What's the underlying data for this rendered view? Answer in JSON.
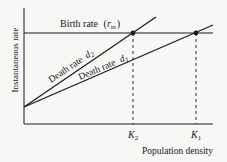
{
  "diagram": {
    "y_axis_label": "Instantaneous rate",
    "x_axis_label": "Population density",
    "birth_rate": {
      "label": "Birth rate",
      "symbol": "r",
      "subscript": "m"
    },
    "death_rate_2": {
      "label": "Death rate",
      "symbol": "d",
      "subscript": "2"
    },
    "death_rate_1": {
      "label": "Death rate",
      "symbol": "d",
      "subscript": "1"
    },
    "k2": {
      "symbol": "K",
      "subscript": "2"
    },
    "k1": {
      "symbol": "K",
      "subscript": "1"
    },
    "colors": {
      "line": "#1a1a1a",
      "background": "#f7f7f5"
    }
  }
}
